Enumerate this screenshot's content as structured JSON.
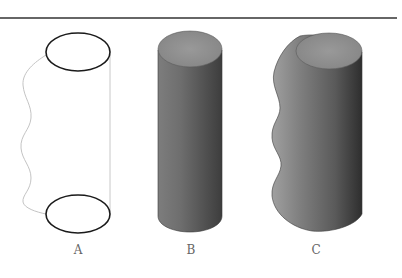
{
  "figure": {
    "labels": {
      "a": "A",
      "b": "B",
      "c": "C"
    },
    "panels": [
      {
        "id": "A",
        "description": "wireframe cylinder outline with wavy left profile and straight right edge"
      },
      {
        "id": "B",
        "description": "shaded straight cylinder"
      },
      {
        "id": "C",
        "description": "shaded cylinder with wavy left side (surface of revolution)"
      }
    ],
    "colors": {
      "rule": "#333333",
      "outline": "#1a1a1a",
      "wire": "#bdbdbd",
      "top_face": "#8c8c8c",
      "shade_light": "#8a8a8a",
      "shade_dark": "#3a3a3a",
      "label": "#666666"
    }
  }
}
